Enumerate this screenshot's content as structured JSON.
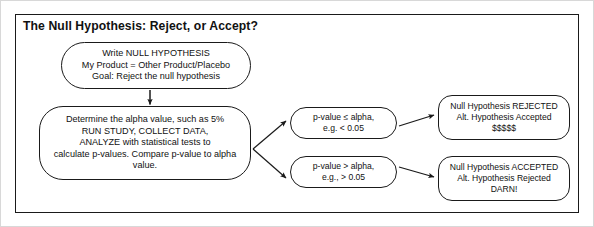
{
  "diagram": {
    "title": "The Null Hypothesis: Reject, or Accept?",
    "nodes": {
      "hypothesis": {
        "name": "write-null-hypothesis",
        "lines": [
          "Write NULL HYPOTHESIS",
          "My Product = Other Product/Placebo",
          "Goal: Reject the null hypothesis"
        ]
      },
      "analysis": {
        "name": "determine-alpha-and-run-study",
        "lines": [
          "Determine the alpha value, such as 5%",
          "RUN STUDY, COLLECT DATA,",
          "ANALYZE with statistical tests to",
          "calculate p-values. Compare p-value to alpha",
          "value."
        ]
      },
      "pvalue_le": {
        "name": "p-value-less-than-or-equal-alpha",
        "lines": [
          "p-value ≤ alpha,",
          "e.g. < 0.05"
        ]
      },
      "pvalue_gt": {
        "name": "p-value-greater-than-alpha",
        "lines": [
          "p-value > alpha,",
          "e.g., > 0.05"
        ]
      },
      "rejected": {
        "name": "null-hypothesis-rejected",
        "lines": [
          "Null Hypothesis REJECTED",
          "Alt. Hypothesis Accepted",
          "$$$$$"
        ]
      },
      "accepted": {
        "name": "null-hypothesis-accepted",
        "lines": [
          "Null Hypothesis ACCEPTED",
          "Alt. Hypothesis Rejected",
          "DARN!"
        ]
      }
    },
    "colors": {
      "stroke": "#1a1a1a",
      "background": "#ffffff",
      "text": "#111111"
    }
  }
}
